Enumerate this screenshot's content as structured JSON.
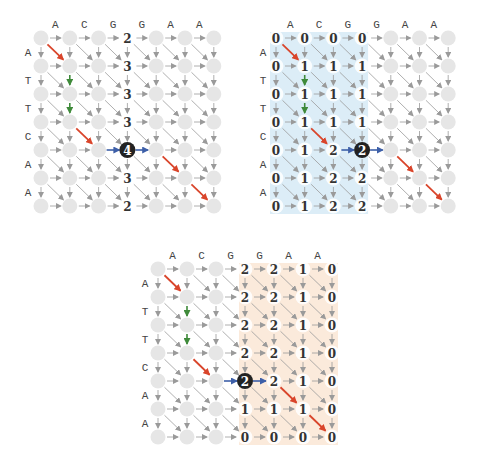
{
  "colors": {
    "node": "#e6e6e6",
    "edge": "#9a9a9a",
    "red": "#d9452b",
    "green": "#3f8a3a",
    "blue": "#3d5fa8",
    "black_node": "#222222",
    "blue_region": "#dcedf7",
    "orange_region": "#fbeadb",
    "label": "#444444",
    "number": "#333333"
  },
  "sequences": {
    "columns": [
      "A",
      "C",
      "G",
      "G",
      "A",
      "A"
    ],
    "rows": [
      "A",
      "T",
      "T",
      "C",
      "A",
      "A"
    ]
  },
  "highlight_path": {
    "red_diagonals": [
      [
        0,
        0
      ],
      [
        3,
        1
      ],
      [
        4,
        4
      ],
      [
        5,
        5
      ]
    ],
    "green_verticals": [
      [
        1,
        1
      ],
      [
        2,
        1
      ]
    ],
    "blue_horizontals": [
      [
        4,
        2
      ],
      [
        4,
        3
      ]
    ]
  },
  "panels": [
    {
      "id": "full-alignment",
      "origin": [
        41,
        38
      ],
      "spacing": [
        28.8,
        28
      ],
      "middle_column": 3,
      "middle_row_index": 4,
      "middle_value": "4",
      "region": null,
      "values": [
        [
          null,
          null,
          null,
          "2",
          null,
          null,
          null
        ],
        [
          null,
          null,
          null,
          "3",
          null,
          null,
          null
        ],
        [
          null,
          null,
          null,
          "3",
          null,
          null,
          null
        ],
        [
          null,
          null,
          null,
          "3",
          null,
          null,
          null
        ],
        [
          null,
          null,
          null,
          "4",
          null,
          null,
          null
        ],
        [
          null,
          null,
          null,
          "3",
          null,
          null,
          null
        ],
        [
          null,
          null,
          null,
          "2",
          null,
          null,
          null
        ]
      ]
    },
    {
      "id": "forward-half",
      "origin": [
        276,
        38
      ],
      "spacing": [
        28.7,
        28
      ],
      "middle_column": 3,
      "middle_row_index": 4,
      "middle_value": "2",
      "region": {
        "color_key": "blue_region",
        "from_col": 0,
        "to_col": 3
      },
      "values": [
        [
          "0",
          "0",
          "0",
          "0",
          null,
          null,
          null
        ],
        [
          "0",
          "1",
          "1",
          "1",
          null,
          null,
          null
        ],
        [
          "0",
          "1",
          "1",
          "1",
          null,
          null,
          null
        ],
        [
          "0",
          "1",
          "1",
          "1",
          null,
          null,
          null
        ],
        [
          "0",
          "1",
          "2",
          "2",
          null,
          null,
          null
        ],
        [
          "0",
          "1",
          "2",
          "2",
          null,
          null,
          null
        ],
        [
          "0",
          "1",
          "2",
          "2",
          null,
          null,
          null
        ]
      ]
    },
    {
      "id": "backward-half",
      "origin": [
        158,
        269
      ],
      "spacing": [
        29,
        28
      ],
      "middle_column": 3,
      "middle_row_index": 4,
      "middle_value": "2",
      "region": {
        "color_key": "orange_region",
        "from_col": 3,
        "to_col": 6
      },
      "values": [
        [
          null,
          null,
          null,
          "2",
          "2",
          "1",
          "0"
        ],
        [
          null,
          null,
          null,
          "2",
          "2",
          "1",
          "0"
        ],
        [
          null,
          null,
          null,
          "2",
          "2",
          "1",
          "0"
        ],
        [
          null,
          null,
          null,
          "2",
          "2",
          "1",
          "0"
        ],
        [
          null,
          null,
          null,
          "2",
          "2",
          "1",
          "0"
        ],
        [
          null,
          null,
          null,
          "1",
          "1",
          "1",
          "0"
        ],
        [
          null,
          null,
          null,
          "0",
          "0",
          "0",
          "0"
        ]
      ]
    }
  ]
}
